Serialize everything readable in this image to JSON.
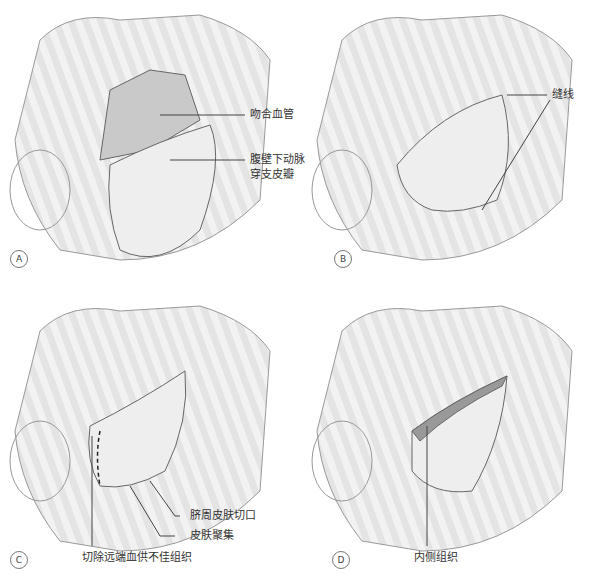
{
  "figure": {
    "panels": [
      {
        "id": "A",
        "labels": [
          "吻合血管",
          "腹壁下动脉",
          "穿支皮瓣"
        ]
      },
      {
        "id": "B",
        "labels": [
          "缝线"
        ]
      },
      {
        "id": "C",
        "labels": [
          "脐周皮肤切口",
          "皮肤聚集",
          "切除远端血供不佳组织"
        ]
      },
      {
        "id": "D",
        "labels": [
          "内侧组织"
        ]
      }
    ]
  }
}
